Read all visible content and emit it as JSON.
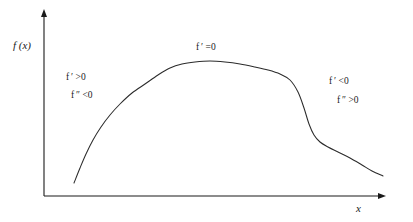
{
  "figure": {
    "background_color": "#ffffff",
    "axis_color": "#1a1a1a",
    "curve_color": "#2b2b2b",
    "axes": {
      "y_label": "f (x)",
      "x_label": "x"
    },
    "annotations": {
      "left_first": "f ′ >0",
      "left_second": "f ″ <0",
      "top_center": "f ′ =0",
      "right_first": "f ′ <0",
      "right_second": "f ″ >0"
    }
  },
  "chart_data": {
    "type": "line",
    "title": "",
    "subtitle": "",
    "xlabel": "x",
    "ylabel": "f (x)",
    "grid": false,
    "legend_position": "none",
    "xlim": [
      0,
      413
    ],
    "ylim": [
      0,
      222
    ],
    "axis_origin_px": [
      44,
      196
    ],
    "y_axis_top_px": [
      44,
      11
    ],
    "x_axis_right_px": [
      385,
      196
    ],
    "series": [
      {
        "name": "f(x)",
        "description": "Smooth curve: steep concave-down rise, flat plateau maximum, steep concave-up drop, then shallow tapering decline",
        "points_px": [
          [
            74,
            183
          ],
          [
            80,
            168
          ],
          [
            86,
            154
          ],
          [
            93,
            140
          ],
          [
            101,
            127
          ],
          [
            110,
            115
          ],
          [
            120,
            104
          ],
          [
            132,
            93
          ],
          [
            145,
            84
          ],
          [
            158,
            75
          ],
          [
            170,
            68
          ],
          [
            182,
            64
          ],
          [
            195,
            62
          ],
          [
            210,
            61
          ],
          [
            225,
            62
          ],
          [
            240,
            64
          ],
          [
            255,
            67
          ],
          [
            268,
            70
          ],
          [
            280,
            74
          ],
          [
            290,
            80
          ],
          [
            298,
            92
          ],
          [
            304,
            108
          ],
          [
            309,
            124
          ],
          [
            314,
            135
          ],
          [
            320,
            142
          ],
          [
            328,
            147
          ],
          [
            338,
            152
          ],
          [
            350,
            158
          ],
          [
            362,
            165
          ],
          [
            372,
            171
          ],
          [
            383,
            176
          ]
        ]
      }
    ],
    "annotations": [
      {
        "text": "f ′ >0",
        "x_px": 68,
        "y_px": 76,
        "region": "left-rising"
      },
      {
        "text": "f ″ <0",
        "x_px": 72,
        "y_px": 94,
        "region": "left-rising"
      },
      {
        "text": "f ′ =0",
        "x_px": 198,
        "y_px": 46,
        "region": "plateau"
      },
      {
        "text": "f ′ <0",
        "x_px": 330,
        "y_px": 80,
        "region": "right-falling"
      },
      {
        "text": "f ″ >0",
        "x_px": 338,
        "y_px": 99,
        "region": "right-falling"
      }
    ]
  }
}
